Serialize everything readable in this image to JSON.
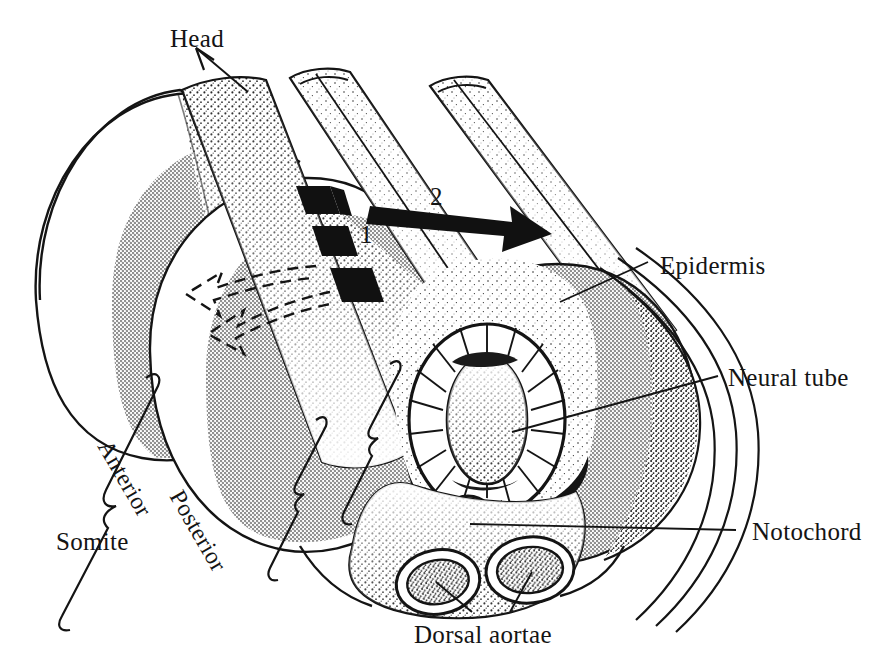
{
  "figure": {
    "orientation_label": "Head",
    "colors": {
      "ink": "#141414",
      "somite_gray": "#b2b2b2",
      "somite_gray_dark": "#a0a0a0",
      "stipple": "#2a2a2a",
      "paper": "#ffffff",
      "arrow_black": "#111111"
    }
  },
  "labels": {
    "head": "Head",
    "epidermis": "Epidermis",
    "neural_tube": "Neural tube",
    "notochord": "Notochord",
    "dorsal_aortae": "Dorsal aortae",
    "somite": "Somite",
    "anterior": "Anterior",
    "posterior": "Posterior"
  },
  "annotations": {
    "step_one": "1",
    "step_two": "2"
  },
  "structures": [
    {
      "name": "somite-block-anterior",
      "label": "Somite",
      "fill": "#b2b2b2"
    },
    {
      "name": "somite-block-posterior",
      "label": "Somite",
      "fill": "#b2b2b2"
    },
    {
      "name": "neural-tube",
      "label": "Neural tube",
      "fill": "#ffffff"
    },
    {
      "name": "notochord",
      "label": "Notochord",
      "fill": "#ffffff"
    },
    {
      "name": "dorsal-aorta-left",
      "label": "Dorsal aortae",
      "fill": "#ffffff"
    },
    {
      "name": "dorsal-aorta-right",
      "label": "Dorsal aortae",
      "fill": "#ffffff"
    },
    {
      "name": "epidermis-flap",
      "label": "Epidermis",
      "fill": "#ffffff"
    }
  ],
  "arrows": [
    {
      "name": "head-direction-arrow",
      "style": "thin-line",
      "points_to": "Head"
    },
    {
      "name": "migration-arrow-1",
      "style": "solid-black-zigzag",
      "number": "1"
    },
    {
      "name": "migration-arrow-2",
      "style": "solid-black-straight",
      "number": "2"
    },
    {
      "name": "dashed-migration-arrows",
      "style": "dashed-outline-zigzag",
      "count": 2
    }
  ]
}
